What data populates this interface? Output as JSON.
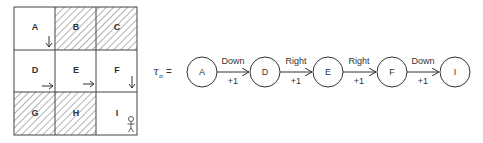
{
  "grid": {
    "cells": [
      {
        "label": "A",
        "hatched": false,
        "arrow": "down"
      },
      {
        "label": "B",
        "hatched": true,
        "arrow": null
      },
      {
        "label": "C",
        "hatched": true,
        "arrow": null
      },
      {
        "label": "D",
        "hatched": false,
        "arrow": "right"
      },
      {
        "label": "E",
        "hatched": false,
        "arrow": "right"
      },
      {
        "label": "F",
        "hatched": false,
        "arrow": "down"
      },
      {
        "label": "G",
        "hatched": true,
        "arrow": null
      },
      {
        "label": "H",
        "hatched": true,
        "arrow": null
      },
      {
        "label": "I",
        "hatched": false,
        "arrow": null,
        "icon": "person-icon"
      }
    ]
  },
  "trajectory": {
    "symbol": "τ",
    "subscript": "π",
    "equals": "=",
    "nodes": [
      "A",
      "D",
      "E",
      "F",
      "I"
    ],
    "edges": [
      {
        "action": "Down",
        "reward": "+1"
      },
      {
        "action": "Right",
        "reward": "+1"
      },
      {
        "action": "Right",
        "reward": "+1"
      },
      {
        "action": "Down",
        "reward": "+1"
      }
    ]
  }
}
